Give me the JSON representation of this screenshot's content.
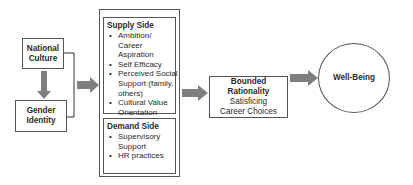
{
  "diagram": {
    "national_culture": "National Culture",
    "gender_identity": "Gender Identity",
    "supply_side": {
      "title": "Supply Side",
      "items": [
        "Ambition/ Career Aspiration",
        "Self Efficacy",
        "Perceived Social Support (family, others)",
        "Cultural Value Orientation"
      ]
    },
    "demand_side": {
      "title": "Demand Side",
      "items": [
        "Supervisory Support",
        "HR practices"
      ]
    },
    "bounded": {
      "title": "Bounded Rationality",
      "subtitle": "Satisficing Career Choices"
    },
    "wellbeing": "Well-Being",
    "colors": {
      "arrow": "#7f7f7f",
      "border": "#555555"
    }
  }
}
